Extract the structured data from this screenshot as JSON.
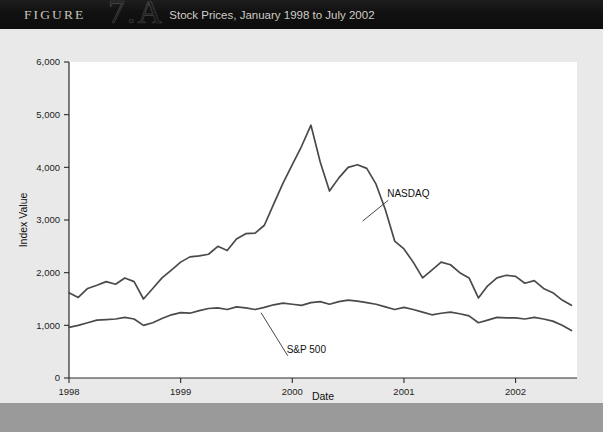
{
  "header": {
    "figure_word": "FIGURE",
    "figure_number": "7.A",
    "title": "Stock Prices, January 1998 to July 2002",
    "bar_color": "#111111",
    "text_color": "#d8d4cc"
  },
  "chart_data": {
    "type": "line",
    "title": "Stock Prices, January 1998 to July 2002",
    "xlabel": "Date",
    "ylabel": "Index Value",
    "xlim": [
      1998.0,
      2002.55
    ],
    "ylim": [
      0,
      6000
    ],
    "yticks": [
      0,
      1000,
      2000,
      3000,
      4000,
      5000,
      6000
    ],
    "ytick_labels": [
      "0",
      "1,000",
      "2,000",
      "3,000",
      "4,000",
      "5,000",
      "6,000"
    ],
    "xticks": [
      1998,
      1999,
      2000,
      2001,
      2002
    ],
    "xtick_labels": [
      "1998",
      "1999",
      "2000",
      "2001",
      "2002"
    ],
    "grid": false,
    "legend_position": "inline-annotation",
    "line_color": "#4a4a4a",
    "plot_background": "#ffffff",
    "x": [
      1998.0,
      1998.083,
      1998.167,
      1998.25,
      1998.333,
      1998.417,
      1998.5,
      1998.583,
      1998.667,
      1998.75,
      1998.833,
      1998.917,
      1999.0,
      1999.083,
      1999.167,
      1999.25,
      1999.333,
      1999.417,
      1999.5,
      1999.583,
      1999.667,
      1999.75,
      1999.833,
      1999.917,
      2000.0,
      2000.083,
      2000.167,
      2000.25,
      2000.333,
      2000.417,
      2000.5,
      2000.583,
      2000.667,
      2000.75,
      2000.833,
      2000.917,
      2001.0,
      2001.083,
      2001.167,
      2001.25,
      2001.333,
      2001.417,
      2001.5,
      2001.583,
      2001.667,
      2001.75,
      2001.833,
      2001.917,
      2002.0,
      2002.083,
      2002.167,
      2002.25,
      2002.333,
      2002.417,
      2002.5
    ],
    "series": [
      {
        "name": "NASDAQ",
        "label": "NASDAQ",
        "values": [
          1620,
          1530,
          1700,
          1760,
          1830,
          1780,
          1900,
          1830,
          1500,
          1700,
          1900,
          2050,
          2200,
          2300,
          2320,
          2350,
          2500,
          2420,
          2640,
          2740,
          2750,
          2900,
          3300,
          3700,
          4050,
          4400,
          4800,
          4100,
          3550,
          3800,
          4000,
          4050,
          3980,
          3680,
          3200,
          2600,
          2450,
          2200,
          1900,
          2050,
          2200,
          2150,
          2000,
          1900,
          1520,
          1750,
          1900,
          1950,
          1930,
          1800,
          1850,
          1700,
          1620,
          1480,
          1380
        ]
      },
      {
        "name": "S&P 500",
        "label": "S&P 500",
        "values": [
          960,
          1000,
          1050,
          1100,
          1110,
          1120,
          1150,
          1120,
          1000,
          1050,
          1130,
          1200,
          1240,
          1230,
          1280,
          1320,
          1330,
          1300,
          1350,
          1330,
          1300,
          1340,
          1390,
          1420,
          1400,
          1380,
          1430,
          1450,
          1400,
          1450,
          1480,
          1460,
          1430,
          1400,
          1350,
          1300,
          1340,
          1300,
          1250,
          1200,
          1230,
          1250,
          1220,
          1180,
          1050,
          1100,
          1150,
          1140,
          1140,
          1120,
          1150,
          1120,
          1080,
          1000,
          900
        ]
      }
    ],
    "annotations": [
      {
        "text": "NASDAQ",
        "label_x": 2000.85,
        "label_y": 3430,
        "point_x": 2000.63,
        "point_y": 2980
      },
      {
        "text": "S&P 500",
        "label_x": 1999.95,
        "label_y": 480,
        "point_x": 1999.72,
        "point_y": 1240
      }
    ]
  }
}
